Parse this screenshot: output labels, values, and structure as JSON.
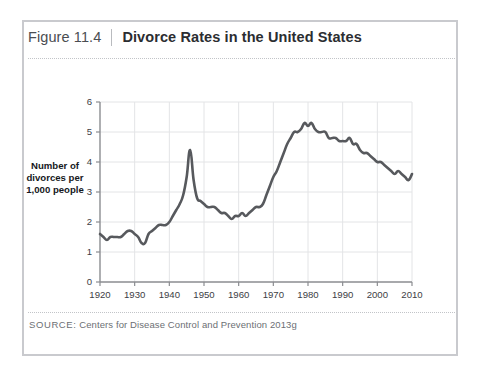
{
  "figure": {
    "number": "Figure 11.4",
    "separator": "|",
    "title": "Divorce Rates in the United States",
    "source_label": "SOURCE:",
    "source_text": "Centers for Disease Control and Prevention 2013g"
  },
  "colors": {
    "line": "#57595d",
    "border": "#c9cace",
    "grid": "#e3e4e6",
    "axis": "#8b8d91",
    "text": "#2b2d31",
    "muted": "#6c6f74"
  },
  "chart_data": {
    "type": "line",
    "title": "Divorce Rates in the United States",
    "xlabel": "",
    "ylabel": "Number of divorces per 1,000 people",
    "xlim": [
      1920,
      2010
    ],
    "ylim": [
      0,
      6
    ],
    "xticks": [
      1920,
      1930,
      1940,
      1950,
      1960,
      1970,
      1980,
      1990,
      2000,
      2010
    ],
    "yticks": [
      0,
      1,
      2,
      3,
      4,
      5,
      6
    ],
    "grid": true,
    "legend": "none",
    "x": [
      1920,
      1921,
      1922,
      1923,
      1924,
      1925,
      1926,
      1927,
      1928,
      1929,
      1930,
      1931,
      1932,
      1933,
      1934,
      1935,
      1936,
      1937,
      1938,
      1939,
      1940,
      1941,
      1942,
      1943,
      1944,
      1945,
      1946,
      1947,
      1948,
      1949,
      1950,
      1951,
      1952,
      1953,
      1954,
      1955,
      1956,
      1957,
      1958,
      1959,
      1960,
      1961,
      1962,
      1963,
      1964,
      1965,
      1966,
      1967,
      1968,
      1969,
      1970,
      1971,
      1972,
      1973,
      1974,
      1975,
      1976,
      1977,
      1978,
      1979,
      1980,
      1981,
      1982,
      1983,
      1984,
      1985,
      1986,
      1987,
      1988,
      1989,
      1990,
      1991,
      1992,
      1993,
      1994,
      1995,
      1996,
      1997,
      1998,
      1999,
      2000,
      2001,
      2002,
      2003,
      2004,
      2005,
      2006,
      2007,
      2008,
      2009,
      2010
    ],
    "values": [
      1.6,
      1.5,
      1.4,
      1.5,
      1.5,
      1.5,
      1.5,
      1.6,
      1.7,
      1.7,
      1.6,
      1.5,
      1.3,
      1.3,
      1.6,
      1.7,
      1.8,
      1.9,
      1.9,
      1.9,
      2.0,
      2.2,
      2.4,
      2.6,
      2.9,
      3.5,
      4.4,
      3.4,
      2.8,
      2.7,
      2.6,
      2.5,
      2.5,
      2.5,
      2.4,
      2.3,
      2.3,
      2.2,
      2.1,
      2.2,
      2.2,
      2.3,
      2.2,
      2.3,
      2.4,
      2.5,
      2.5,
      2.6,
      2.9,
      3.2,
      3.5,
      3.7,
      4.0,
      4.3,
      4.6,
      4.8,
      5.0,
      5.0,
      5.1,
      5.3,
      5.2,
      5.3,
      5.1,
      5.0,
      5.0,
      5.0,
      4.8,
      4.8,
      4.8,
      4.7,
      4.7,
      4.7,
      4.8,
      4.6,
      4.6,
      4.4,
      4.3,
      4.3,
      4.2,
      4.1,
      4.0,
      4.0,
      3.9,
      3.8,
      3.7,
      3.6,
      3.7,
      3.6,
      3.5,
      3.4,
      3.6
    ]
  },
  "axes": {
    "y_tick_labels": [
      "6",
      "5",
      "4",
      "3",
      "2",
      "1",
      "0"
    ],
    "x_tick_labels": [
      "1920",
      "1930",
      "1940",
      "1950",
      "1960",
      "1970",
      "1980",
      "1990",
      "2000",
      "2010"
    ]
  }
}
